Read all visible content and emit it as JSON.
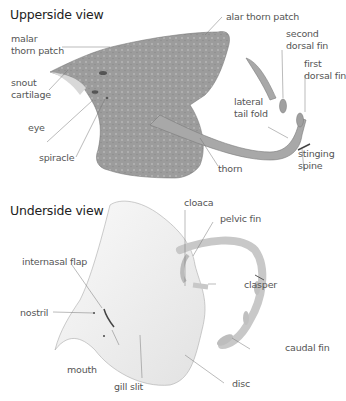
{
  "upper": {
    "title": "Upperside view",
    "labels": {
      "malar": "malar\nthorn patch",
      "alar": "alar thorn patch",
      "snout": "snout\ncartilage",
      "eye": "eye",
      "spiracle": "spiracle",
      "second_dorsal": "second\ndorsal fin",
      "first_dorsal": "first\ndorsal fin",
      "lateral_tail": "lateral\ntail fold",
      "thorn": "thorn",
      "stinging_spine": "stinging\nspine"
    },
    "body_color": "#9a9a9a"
  },
  "under": {
    "title": "Underside view",
    "labels": {
      "internasal": "internasal flap",
      "nostril": "nostril",
      "mouth": "mouth",
      "gill_slit": "gill slit",
      "cloaca": "cloaca",
      "pelvic_fin": "pelvic fin",
      "clasper": "clasper",
      "caudal_fin": "caudal fin",
      "disc": "disc"
    },
    "body_color": "#f2f2f2"
  }
}
